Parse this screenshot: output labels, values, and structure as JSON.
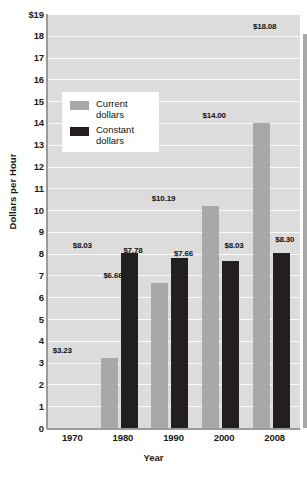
{
  "chart_data": {
    "type": "bar",
    "title": "",
    "xlabel": "Year",
    "ylabel": "Dollars per Hour",
    "categories": [
      "1970",
      "1980",
      "1990",
      "2000",
      "2008"
    ],
    "series": [
      {
        "name": "Current dollars",
        "color": "#a8a8a8",
        "values": [
          3.23,
          6.66,
          10.19,
          14.0,
          18.08
        ],
        "labels": [
          "$3.23",
          "$6.66",
          "$10.19",
          "$14.00",
          "$18.08"
        ]
      },
      {
        "name": "Constant dollars",
        "color": "#231f20",
        "values": [
          8.03,
          7.78,
          7.66,
          8.03,
          8.3
        ],
        "labels": [
          "$8.03",
          "$7.78",
          "$7.66",
          "$8.03",
          "$8.30"
        ]
      }
    ],
    "ylim": [
      0,
      19
    ],
    "yticks": [
      "0",
      "1",
      "2",
      "3",
      "4",
      "5",
      "6",
      "7",
      "8",
      "9",
      "10",
      "11",
      "12",
      "13",
      "14",
      "15",
      "16",
      "17",
      "18",
      "$19"
    ],
    "grid": true,
    "legend_position": "upper-left-inside",
    "plot_background": "#dcdcdc",
    "gridline_color": "#fbfbfb"
  },
  "legend": {
    "items": [
      {
        "label_line1": "Current",
        "label_line2": "dollars"
      },
      {
        "label_line1": "Constant",
        "label_line2": "dollars"
      }
    ]
  }
}
